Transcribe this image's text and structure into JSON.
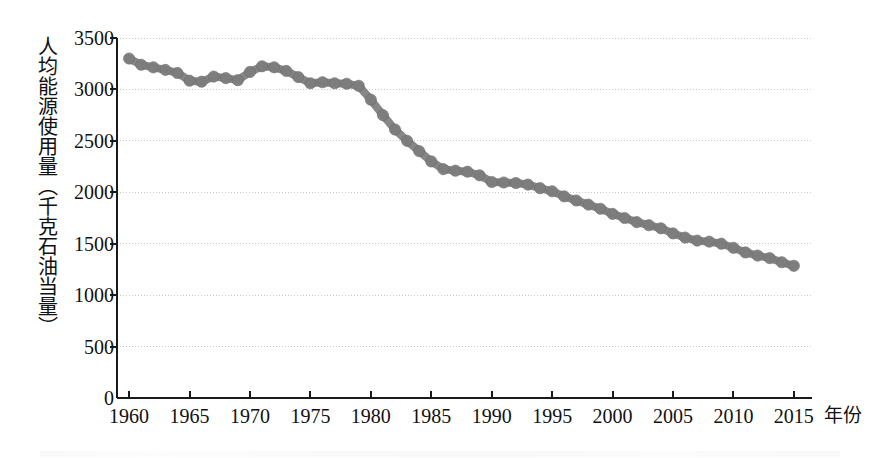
{
  "chart_data": {
    "type": "line",
    "title": "",
    "subtitle": "",
    "xlabel": "年份",
    "ylabel": "人均能源使用量（千克石油当量）",
    "xlim": [
      1959,
      2016.5
    ],
    "ylim": [
      0,
      3500
    ],
    "ytick_labels": [
      "0",
      "500",
      "1000",
      "1500",
      "2000",
      "2500",
      "3000",
      "3500"
    ],
    "ytick_values": [
      0,
      500,
      1000,
      1500,
      2000,
      2500,
      3000,
      3500
    ],
    "xtick_labels": [
      "1960",
      "1965",
      "1970",
      "1975",
      "1980",
      "1985",
      "1990",
      "1995",
      "2000",
      "2005",
      "2010",
      "2015"
    ],
    "xtick_values": [
      1960,
      1965,
      1970,
      1975,
      1980,
      1985,
      1990,
      1995,
      2000,
      2005,
      2010,
      2015
    ],
    "grid": true,
    "grid_axis": "y",
    "legend": "none",
    "marker": "circle",
    "marker_color": "#7d7d7d",
    "line_color": "#7d7d7d",
    "axis_color": "#1a1a1a",
    "grid_color": "#c8c8c8",
    "x": [
      1960,
      1961,
      1962,
      1963,
      1964,
      1965,
      1966,
      1967,
      1968,
      1969,
      1970,
      1971,
      1972,
      1973,
      1974,
      1975,
      1976,
      1977,
      1978,
      1979,
      1980,
      1981,
      1982,
      1983,
      1984,
      1985,
      1986,
      1987,
      1988,
      1989,
      1990,
      1991,
      1992,
      1993,
      1994,
      1995,
      1996,
      1997,
      1998,
      1999,
      2000,
      2001,
      2002,
      2003,
      2004,
      2005,
      2006,
      2007,
      2008,
      2009,
      2010,
      2011,
      2012,
      2013,
      2014,
      2015
    ],
    "values": [
      3300,
      3240,
      3215,
      3190,
      3160,
      3085,
      3075,
      3125,
      3110,
      3090,
      3170,
      3225,
      3215,
      3180,
      3120,
      3060,
      3070,
      3060,
      3055,
      3035,
      2900,
      2750,
      2610,
      2500,
      2400,
      2300,
      2225,
      2210,
      2200,
      2165,
      2100,
      2095,
      2090,
      2075,
      2040,
      2010,
      1960,
      1920,
      1880,
      1840,
      1790,
      1750,
      1710,
      1680,
      1650,
      1600,
      1560,
      1530,
      1520,
      1500,
      1460,
      1415,
      1385,
      1360,
      1320,
      1285
    ],
    "series": [
      {
        "name": "人均能源使用量",
        "values": [
          3300,
          3240,
          3215,
          3190,
          3160,
          3085,
          3075,
          3125,
          3110,
          3090,
          3170,
          3225,
          3215,
          3180,
          3120,
          3060,
          3070,
          3060,
          3055,
          3035,
          2900,
          2750,
          2610,
          2500,
          2400,
          2300,
          2225,
          2210,
          2200,
          2165,
          2100,
          2095,
          2090,
          2075,
          2040,
          2010,
          1960,
          1920,
          1880,
          1840,
          1790,
          1750,
          1710,
          1680,
          1650,
          1600,
          1560,
          1530,
          1520,
          1500,
          1460,
          1415,
          1385,
          1360,
          1320,
          1285
        ]
      }
    ]
  }
}
